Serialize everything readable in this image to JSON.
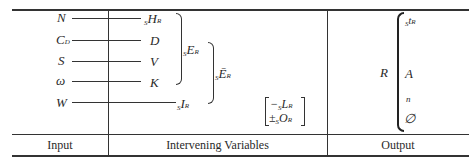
{
  "columns": [
    {
      "id": "input",
      "label": "Input"
    },
    {
      "id": "intervening",
      "label": "Intervening Variables"
    },
    {
      "id": "output",
      "label": "Output"
    }
  ],
  "input_vars": [
    {
      "symbol": "N",
      "sub": ""
    },
    {
      "symbol": "C",
      "sub": "D"
    },
    {
      "symbol": "S",
      "sub": ""
    },
    {
      "symbol": "ω",
      "sub": ""
    },
    {
      "symbol": "W",
      "sub": ""
    }
  ],
  "intervening_vars": [
    {
      "pre": "S",
      "symbol": "H",
      "sub": "R"
    },
    {
      "pre": "",
      "symbol": "D",
      "sub": ""
    },
    {
      "pre": "",
      "symbol": "V",
      "sub": ""
    },
    {
      "pre": "",
      "symbol": "K",
      "sub": ""
    },
    {
      "pre": "S",
      "symbol": "I",
      "sub": "R"
    }
  ],
  "grouped": {
    "excitatory": {
      "pre": "S",
      "symbol": "E",
      "sub": "R"
    },
    "net_excitatory": {
      "pre": "S",
      "symbol": "Ē",
      "sub": "R"
    }
  },
  "bracket_vars": [
    {
      "sign": "−",
      "pre": "S",
      "symbol": "L",
      "sub": "R"
    },
    {
      "sign": "±",
      "pre": "S",
      "symbol": "O",
      "sub": "R"
    }
  ],
  "output": {
    "response": "R",
    "measures": [
      {
        "pre": "S",
        "symbol": "t",
        "sub": "R"
      },
      {
        "pre": "",
        "symbol": "A",
        "sub": ""
      },
      {
        "pre": "",
        "symbol": "n",
        "sub": ""
      },
      {
        "pre": "",
        "symbol": "∅",
        "sub": ""
      }
    ]
  }
}
